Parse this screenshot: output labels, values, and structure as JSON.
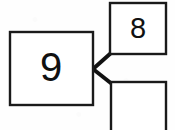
{
  "diagram": {
    "background_color": "#fefefe",
    "line_color": "#111111",
    "box_fill": "#ffffff",
    "box_stroke": "#1a1a1a",
    "whole_box": {
      "label": "9",
      "x": 10,
      "y": 32,
      "width": 83,
      "height": 73,
      "stroke_width": 2.4,
      "font_size": 40,
      "text_x": 51,
      "text_y": 70
    },
    "part_boxes": [
      {
        "label": "8",
        "x": 110,
        "y": 3,
        "width": 56,
        "height": 51,
        "stroke_width": 2.4,
        "font_size": 29,
        "text_x": 138,
        "text_y": 30
      },
      {
        "label": "",
        "x": 111,
        "y": 82,
        "width": 55,
        "height": 55,
        "stroke_width": 2.4,
        "font_size": 29,
        "text_x": 138,
        "text_y": 110
      }
    ],
    "connectors": [
      {
        "name": "connector-to-top-part",
        "x1": 93,
        "y1": 69,
        "x2": 111,
        "y2": 53,
        "stroke_width": 4
      },
      {
        "name": "connector-to-bottom-part",
        "x1": 93,
        "y1": 69,
        "x2": 112,
        "y2": 84,
        "stroke_width": 4
      }
    ]
  }
}
